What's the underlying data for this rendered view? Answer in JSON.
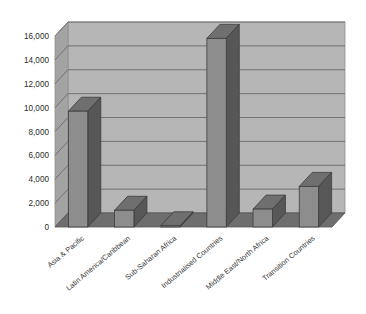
{
  "chart_data": {
    "type": "bar",
    "title": "",
    "subtitle": "",
    "xlabel": "",
    "ylabel": "",
    "categories": [
      "Asia & Pacific",
      "Latin America/Caribbean",
      "Sub-Saharan Africa",
      "Industrialised Countries",
      "Middle East/North Africa",
      "Transition Countries"
    ],
    "values": [
      9700,
      1400,
      100,
      15800,
      1500,
      3400
    ],
    "ylim": [
      0,
      16000
    ],
    "yticks": [
      0,
      2000,
      4000,
      6000,
      8000,
      10000,
      12000,
      14000,
      16000
    ],
    "ytick_labels": [
      "0",
      "2,000",
      "4,000",
      "6,000",
      "8,000",
      "10,000",
      "12,000",
      "14,000",
      "16,000"
    ],
    "grid": true,
    "legend": null,
    "legend_position": "none",
    "style": "3d-column",
    "colors": {
      "bar_front": "#8d8d8d",
      "bar_side": "#575757",
      "bar_top": "#6f6f6f",
      "plot_background": "#b6b6b6",
      "wall_side": "#a3a3a3",
      "floor": "#6e6e6e",
      "gridline": "#6a6a6a",
      "text": "#2b2b2b",
      "page_background": "#ffffff"
    }
  }
}
